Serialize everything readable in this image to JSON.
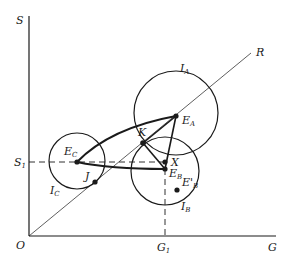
{
  "diagram": {
    "axes": {
      "y_label": "S",
      "x_label": "G",
      "origin_label": "O",
      "s1_label": "S",
      "s1_sub": "1",
      "g1_label": "G",
      "g1_sub": "1"
    },
    "ray": {
      "label": "R"
    },
    "circles": [
      {
        "id": "IA",
        "label": "I",
        "sub": "A"
      },
      {
        "id": "IB",
        "label": "I",
        "sub": "B"
      },
      {
        "id": "IC",
        "label": "I",
        "sub": "C"
      }
    ],
    "points": [
      {
        "id": "EA",
        "label": "E",
        "sub": "A"
      },
      {
        "id": "EB",
        "label": "E",
        "sub": "B"
      },
      {
        "id": "EC",
        "label": "E",
        "sub": "C"
      },
      {
        "id": "EBp",
        "label": "E'",
        "sub": "B"
      },
      {
        "id": "K",
        "label": "K"
      },
      {
        "id": "X",
        "label": "X"
      },
      {
        "id": "J",
        "label": "J"
      }
    ],
    "colors": {
      "ink": "#1a1a1a",
      "background": "#ffffff"
    }
  }
}
